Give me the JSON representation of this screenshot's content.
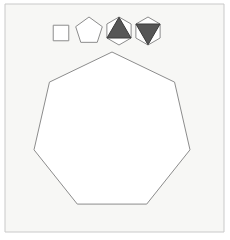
{
  "canvas": {
    "width": 230,
    "height": 240,
    "background_color": "#ffffff",
    "title": "Geometric shapes figure"
  },
  "frame": {
    "name": "figure-border",
    "x": 5,
    "y": 4,
    "width": 219,
    "height": 228,
    "fill_color": "#f7f7f5",
    "stroke_color": "#c9c9c9",
    "stroke_width": 1
  },
  "palette": {
    "panel_background": "#f7f7f5",
    "shape_fill": "#ffffff",
    "shape_stroke": "#8c8c8c",
    "triangle_fill": "#565656",
    "triangle_stroke": "#3a3a3a",
    "frame_stroke": "#c9c9c9"
  },
  "small_shapes": [
    {
      "name": "square",
      "label": "Square",
      "sides": 4,
      "center_x": 61,
      "center_y": 33,
      "radius": 11,
      "rotation_deg": 45,
      "fill": "#ffffff",
      "stroke": "#8c8c8c",
      "stroke_width": 1,
      "inner": null
    },
    {
      "name": "pentagon",
      "label": "Pentagon",
      "sides": 5,
      "center_x": 89,
      "center_y": 31,
      "radius": 14,
      "rotation_deg": 0,
      "fill": "#ffffff",
      "stroke": "#8c8c8c",
      "stroke_width": 1,
      "inner": null
    },
    {
      "name": "hexagon-triangle-up",
      "label": "Hexagon with up triangle",
      "sides": 6,
      "center_x": 119,
      "center_y": 31,
      "radius": 14,
      "rotation_deg": 0,
      "fill": "#ffffff",
      "stroke": "#8c8c8c",
      "stroke_width": 1,
      "inner": {
        "name": "triangle-up",
        "direction": "up",
        "fill": "#565656",
        "stroke": "#3a3a3a",
        "stroke_width": 1
      }
    },
    {
      "name": "hexagon-triangle-down",
      "label": "Hexagon with down triangle",
      "sides": 6,
      "center_x": 148,
      "center_y": 31,
      "radius": 14,
      "rotation_deg": 0,
      "fill": "#ffffff",
      "stroke": "#8c8c8c",
      "stroke_width": 1,
      "inner": {
        "name": "triangle-down",
        "direction": "down",
        "fill": "#565656",
        "stroke": "#3a3a3a",
        "stroke_width": 1
      }
    }
  ],
  "main_shape": {
    "name": "heptagon",
    "label": "Heptagon",
    "sides": 7,
    "center_x": 112,
    "center_y": 132,
    "radius": 80,
    "rotation_deg": 0,
    "fill": "#ffffff",
    "stroke": "#8c8c8c",
    "stroke_width": 1
  }
}
